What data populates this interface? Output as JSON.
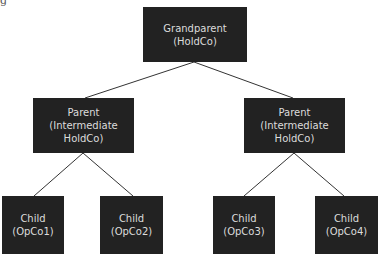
{
  "caption_fragment": "g",
  "colors": {
    "box": "#222222",
    "text": "#dcdcdc",
    "line": "#333333",
    "background": "#ffffff"
  },
  "nodes": {
    "grandparent": {
      "line1": "Grandparent",
      "line2": "(HoldCo)",
      "line3": ""
    },
    "parent_left": {
      "line1": "Parent",
      "line2": "(Intermediate",
      "line3": "HoldCo)"
    },
    "parent_right": {
      "line1": "Parent",
      "line2": "(Intermediate",
      "line3": "HoldCo)"
    },
    "child1": {
      "line1": "Child",
      "line2": "(OpCo1)"
    },
    "child2": {
      "line1": "Child",
      "line2": "(OpCo2)"
    },
    "child3": {
      "line1": "Child",
      "line2": "(OpCo3)"
    },
    "child4": {
      "line1": "Child",
      "line2": "(OpCo4)"
    }
  },
  "edges": [
    [
      "grandparent",
      "parent_left"
    ],
    [
      "grandparent",
      "parent_right"
    ],
    [
      "parent_left",
      "child1"
    ],
    [
      "parent_left",
      "child2"
    ],
    [
      "parent_right",
      "child3"
    ],
    [
      "parent_right",
      "child4"
    ]
  ]
}
